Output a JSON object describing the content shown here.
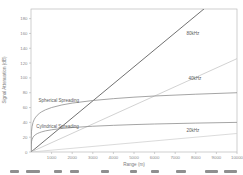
{
  "chart_data": {
    "type": "line",
    "title": "",
    "xlabel": "Range (m)",
    "ylabel": "Signal Attenuation (dB)",
    "xlim": [
      0,
      10000
    ],
    "ylim": [
      0,
      193
    ],
    "x_ticks": [
      1000,
      2000,
      3000,
      4000,
      5000,
      6000,
      7000,
      8000,
      9000,
      10000
    ],
    "y_ticks": [
      0,
      20,
      40,
      60,
      80,
      100,
      120,
      140,
      160,
      180
    ],
    "grid": false,
    "legend_position": "inline-labels",
    "axis_color": "#b0b0b0",
    "tick_label_color": "#8a8a8a",
    "series": [
      {
        "name": "80kHz",
        "color": "#4d4d4d",
        "x": [
          0,
          10000
        ],
        "y": [
          0,
          230
        ],
        "label": {
          "text": "80kHz",
          "x": 7550,
          "y": 158
        }
      },
      {
        "name": "40kHz",
        "color": "#c6c6c6",
        "x": [
          0,
          10000
        ],
        "y": [
          0,
          126
        ],
        "label": {
          "text": "40kHz",
          "x": 7650,
          "y": 97
        }
      },
      {
        "name": "20kHz",
        "color": "#d2d2d2",
        "x": [
          0,
          10000
        ],
        "y": [
          0,
          25
        ],
        "label": {
          "text": "20kHz",
          "x": 7550,
          "y": 27
        }
      },
      {
        "name": "Spherical Spreading",
        "color": "#8e8e8e",
        "x": [
          1,
          10,
          25,
          50,
          100,
          150,
          200,
          300,
          400,
          500,
          700,
          1000,
          1500,
          2000,
          3000,
          4000,
          5000,
          6000,
          8000,
          10000
        ],
        "y": [
          0,
          20,
          28,
          34,
          40,
          43.5,
          46,
          49.5,
          52,
          54,
          56.9,
          60,
          63.5,
          66,
          69.5,
          72,
          74,
          75.6,
          78,
          80
        ],
        "label": {
          "text": "Spherical Spreading",
          "x": 360,
          "y": 68
        }
      },
      {
        "name": "Cylindrical Spreading",
        "color": "#8e8e8e",
        "x": [
          1,
          10,
          25,
          50,
          100,
          150,
          200,
          300,
          400,
          500,
          700,
          1000,
          1500,
          2000,
          3000,
          4000,
          5000,
          6000,
          8000,
          10000
        ],
        "y": [
          0,
          10,
          14,
          17,
          20,
          21.8,
          23,
          24.8,
          26,
          27,
          28.5,
          30,
          31.8,
          33,
          34.8,
          36,
          37,
          37.8,
          39,
          40
        ],
        "label": {
          "text": "Cylindrical Spreading",
          "x": 260,
          "y": 32
        }
      }
    ]
  }
}
